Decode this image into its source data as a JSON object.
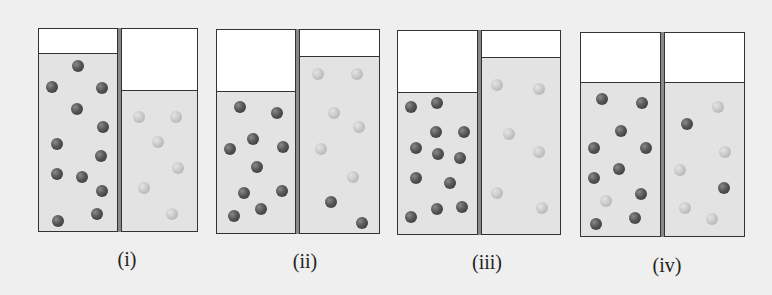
{
  "figure": {
    "colors": {
      "background": "#efefef",
      "liquid": "#e3e3e3",
      "headspace": "#ffffff",
      "dark_particle": "#555555",
      "light_particle": "#c6c6c6",
      "border": "#333333"
    },
    "panels": [
      {
        "label": "(i)",
        "box": {
          "left": 38,
          "top": 28,
          "right": 198,
          "bottom": 232,
          "divider_left": 117,
          "divider_right": 121
        },
        "left_liquid_top": 53,
        "right_liquid_top": 90,
        "particles": [
          {
            "x": 78,
            "y": 66,
            "type": "dark"
          },
          {
            "x": 52,
            "y": 87,
            "type": "dark"
          },
          {
            "x": 102,
            "y": 88,
            "type": "dark"
          },
          {
            "x": 77,
            "y": 109,
            "type": "dark"
          },
          {
            "x": 103,
            "y": 127,
            "type": "dark"
          },
          {
            "x": 57,
            "y": 144,
            "type": "dark"
          },
          {
            "x": 101,
            "y": 156,
            "type": "dark"
          },
          {
            "x": 57,
            "y": 174,
            "type": "dark"
          },
          {
            "x": 82,
            "y": 177,
            "type": "dark"
          },
          {
            "x": 102,
            "y": 191,
            "type": "dark"
          },
          {
            "x": 97,
            "y": 214,
            "type": "dark"
          },
          {
            "x": 58,
            "y": 221,
            "type": "dark"
          },
          {
            "x": 139,
            "y": 117,
            "type": "light"
          },
          {
            "x": 176,
            "y": 117,
            "type": "light"
          },
          {
            "x": 158,
            "y": 142,
            "type": "light"
          },
          {
            "x": 178,
            "y": 168,
            "type": "light"
          },
          {
            "x": 144,
            "y": 188,
            "type": "light"
          },
          {
            "x": 172,
            "y": 214,
            "type": "light"
          }
        ]
      },
      {
        "label": "(ii)",
        "box": {
          "left": 216,
          "top": 29,
          "right": 380,
          "bottom": 234,
          "divider_left": 295,
          "divider_right": 299
        },
        "left_liquid_top": 91,
        "right_liquid_top": 56,
        "particles": [
          {
            "x": 240,
            "y": 107,
            "type": "dark"
          },
          {
            "x": 277,
            "y": 113,
            "type": "dark"
          },
          {
            "x": 253,
            "y": 139,
            "type": "dark"
          },
          {
            "x": 230,
            "y": 149,
            "type": "dark"
          },
          {
            "x": 283,
            "y": 147,
            "type": "dark"
          },
          {
            "x": 257,
            "y": 167,
            "type": "dark"
          },
          {
            "x": 244,
            "y": 193,
            "type": "dark"
          },
          {
            "x": 282,
            "y": 191,
            "type": "dark"
          },
          {
            "x": 261,
            "y": 209,
            "type": "dark"
          },
          {
            "x": 234,
            "y": 216,
            "type": "dark"
          },
          {
            "x": 318,
            "y": 74,
            "type": "light"
          },
          {
            "x": 357,
            "y": 74,
            "type": "light"
          },
          {
            "x": 334,
            "y": 113,
            "type": "light"
          },
          {
            "x": 359,
            "y": 127,
            "type": "light"
          },
          {
            "x": 321,
            "y": 149,
            "type": "light"
          },
          {
            "x": 353,
            "y": 177,
            "type": "light"
          },
          {
            "x": 331,
            "y": 202,
            "type": "dark"
          },
          {
            "x": 362,
            "y": 223,
            "type": "dark"
          }
        ]
      },
      {
        "label": "(iii)",
        "box": {
          "left": 397,
          "top": 30,
          "right": 561,
          "bottom": 235,
          "divider_left": 477,
          "divider_right": 481
        },
        "left_liquid_top": 92,
        "right_liquid_top": 57,
        "particles": [
          {
            "x": 411,
            "y": 107,
            "type": "dark"
          },
          {
            "x": 437,
            "y": 103,
            "type": "dark"
          },
          {
            "x": 436,
            "y": 132,
            "type": "dark"
          },
          {
            "x": 464,
            "y": 132,
            "type": "dark"
          },
          {
            "x": 416,
            "y": 148,
            "type": "dark"
          },
          {
            "x": 438,
            "y": 154,
            "type": "dark"
          },
          {
            "x": 460,
            "y": 158,
            "type": "dark"
          },
          {
            "x": 416,
            "y": 178,
            "type": "dark"
          },
          {
            "x": 450,
            "y": 183,
            "type": "dark"
          },
          {
            "x": 437,
            "y": 209,
            "type": "dark"
          },
          {
            "x": 462,
            "y": 207,
            "type": "dark"
          },
          {
            "x": 411,
            "y": 217,
            "type": "dark"
          },
          {
            "x": 497,
            "y": 85,
            "type": "light"
          },
          {
            "x": 539,
            "y": 89,
            "type": "light"
          },
          {
            "x": 509,
            "y": 134,
            "type": "light"
          },
          {
            "x": 539,
            "y": 152,
            "type": "light"
          },
          {
            "x": 497,
            "y": 193,
            "type": "light"
          },
          {
            "x": 542,
            "y": 208,
            "type": "light"
          }
        ]
      },
      {
        "label": "(iv)",
        "box": {
          "left": 580,
          "top": 32,
          "right": 745,
          "bottom": 237,
          "divider_left": 660,
          "divider_right": 664
        },
        "left_liquid_top": 82,
        "right_liquid_top": 82,
        "particles": [
          {
            "x": 602,
            "y": 99,
            "type": "dark"
          },
          {
            "x": 642,
            "y": 103,
            "type": "dark"
          },
          {
            "x": 621,
            "y": 131,
            "type": "dark"
          },
          {
            "x": 594,
            "y": 148,
            "type": "dark"
          },
          {
            "x": 646,
            "y": 148,
            "type": "dark"
          },
          {
            "x": 619,
            "y": 169,
            "type": "dark"
          },
          {
            "x": 594,
            "y": 178,
            "type": "dark"
          },
          {
            "x": 641,
            "y": 194,
            "type": "dark"
          },
          {
            "x": 635,
            "y": 218,
            "type": "dark"
          },
          {
            "x": 596,
            "y": 224,
            "type": "dark"
          },
          {
            "x": 606,
            "y": 201,
            "type": "light"
          },
          {
            "x": 718,
            "y": 107,
            "type": "light"
          },
          {
            "x": 687,
            "y": 124,
            "type": "dark"
          },
          {
            "x": 725,
            "y": 152,
            "type": "light"
          },
          {
            "x": 680,
            "y": 170,
            "type": "light"
          },
          {
            "x": 724,
            "y": 188,
            "type": "dark"
          },
          {
            "x": 685,
            "y": 208,
            "type": "light"
          },
          {
            "x": 712,
            "y": 219,
            "type": "light"
          }
        ]
      }
    ],
    "labels": [
      {
        "text": "(i)",
        "x": 127,
        "y": 248
      },
      {
        "text": "(ii)",
        "x": 305,
        "y": 250
      },
      {
        "text": "(iii)",
        "x": 487,
        "y": 251
      },
      {
        "text": "(iv)",
        "x": 667,
        "y": 254
      }
    ]
  }
}
